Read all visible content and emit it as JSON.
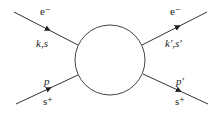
{
  "diagram": {
    "type": "scattering-vertex",
    "vertex": {
      "shape": "circle"
    },
    "legs": [
      {
        "id": "in-electron",
        "particle": "e⁻",
        "momentum_spin": "k,s",
        "direction": "incoming"
      },
      {
        "id": "out-electron",
        "particle": "e⁻",
        "momentum_spin": "k′,s′",
        "direction": "outgoing"
      },
      {
        "id": "in-positron",
        "particle": "s⁺",
        "momentum": "p",
        "direction": "incoming"
      },
      {
        "id": "out-positron",
        "particle": "s⁺",
        "momentum": "p′",
        "direction": "outgoing"
      }
    ],
    "colors": {
      "line": "#333333",
      "text": "#222222"
    }
  }
}
